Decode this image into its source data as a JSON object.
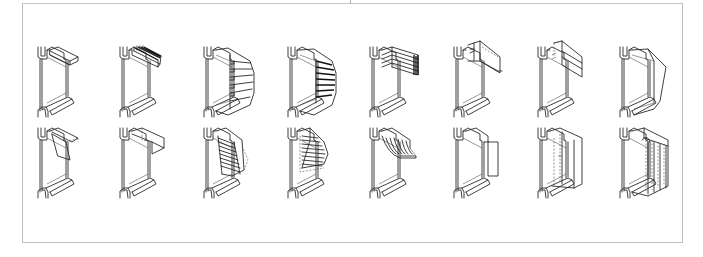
{
  "figure": {
    "type": "technical-illustration",
    "frame_color": "#bdbdbd",
    "line_color": "#2a2a2a",
    "rows": 2,
    "columns": 8,
    "column_x": [
      38,
      120,
      204,
      288,
      370,
      454,
      538,
      620
    ],
    "row_y": [
      47,
      128
    ],
    "items": [
      {
        "row": 1,
        "col": 1,
        "kind": "fixed-horizontal-overhang"
      },
      {
        "row": 1,
        "col": 2,
        "kind": "horizontal-louvered-overhang"
      },
      {
        "row": 1,
        "col": 3,
        "kind": "vertical-fins-egg-crate"
      },
      {
        "row": 1,
        "col": 4,
        "kind": "angled-vertical-fins"
      },
      {
        "row": 1,
        "col": 5,
        "kind": "stacked-horizontal-slats"
      },
      {
        "row": 1,
        "col": 6,
        "kind": "sliding-horizontal-panel"
      },
      {
        "row": 1,
        "col": 7,
        "kind": "vertical-drop-panel"
      },
      {
        "row": 1,
        "col": 8,
        "kind": "hood-with-side-fins"
      },
      {
        "row": 2,
        "col": 1,
        "kind": "hinged-tilting-panel"
      },
      {
        "row": 2,
        "col": 2,
        "kind": "projecting-awning-panel"
      },
      {
        "row": 2,
        "col": 3,
        "kind": "exterior-venetian-blind"
      },
      {
        "row": 2,
        "col": 4,
        "kind": "folding-slatted-awning"
      },
      {
        "row": 2,
        "col": 5,
        "kind": "curved-fabric-awning"
      },
      {
        "row": 2,
        "col": 6,
        "kind": "side-vertical-screen"
      },
      {
        "row": 2,
        "col": 7,
        "kind": "roller-screen-dashed"
      },
      {
        "row": 2,
        "col": 8,
        "kind": "vertical-louvre-screen"
      }
    ]
  }
}
